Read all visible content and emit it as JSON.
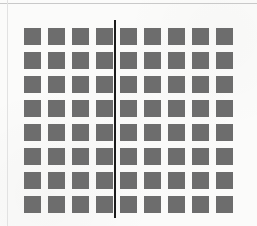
{
  "figure": {
    "title": "Grid of squares bisected by a vertical line",
    "background_color": "#fbfbfa",
    "canvas": {
      "width": 257,
      "height": 226
    }
  },
  "grid": {
    "rows": 8,
    "columns": 9,
    "square_color": "#6d6d6d",
    "square_size": 17,
    "column_pitch": 24,
    "row_pitch": 24,
    "origin_x": 24,
    "origin_y": 28,
    "total_squares": 72,
    "squares_left_of_divider": 32,
    "squares_right_of_divider": 40,
    "cells": [
      [
        1,
        1,
        1,
        1,
        1,
        1,
        1,
        1,
        1
      ],
      [
        1,
        1,
        1,
        1,
        1,
        1,
        1,
        1,
        1
      ],
      [
        1,
        1,
        1,
        1,
        1,
        1,
        1,
        1,
        1
      ],
      [
        1,
        1,
        1,
        1,
        1,
        1,
        1,
        1,
        1
      ],
      [
        1,
        1,
        1,
        1,
        1,
        1,
        1,
        1,
        1
      ],
      [
        1,
        1,
        1,
        1,
        1,
        1,
        1,
        1,
        1
      ],
      [
        1,
        1,
        1,
        1,
        1,
        1,
        1,
        1,
        1
      ],
      [
        1,
        1,
        1,
        1,
        1,
        1,
        1,
        1,
        1
      ]
    ]
  },
  "divider": {
    "color": "#1c1c1c",
    "x": 114,
    "top": 20,
    "bottom": 218,
    "thickness": 2,
    "position_between_columns": "4 and 5"
  },
  "page_rules": {
    "horizontal": {
      "color": "#c9c9c9",
      "y": 3
    },
    "vertical": {
      "color": "#e2e2e2",
      "x": 7
    }
  }
}
